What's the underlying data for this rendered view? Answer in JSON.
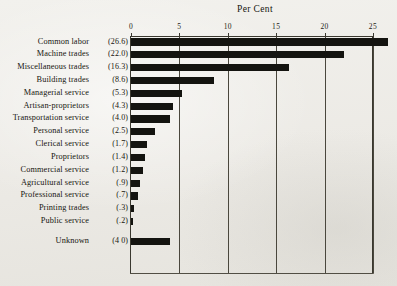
{
  "chart_data": {
    "type": "bar",
    "orientation": "horizontal",
    "title": "Per Cent",
    "xlabel": "",
    "ylabel": "",
    "xlim": [
      0,
      26.6
    ],
    "axis_max_tick": 25,
    "grid": true,
    "legend": null,
    "tick_labels": [
      "0",
      "5",
      "10",
      "15",
      "20",
      "25"
    ],
    "tick_values": [
      0,
      5,
      10,
      15,
      20,
      25
    ],
    "categories": [
      "Common labor",
      "Machine trades",
      "Miscellaneous trades",
      "Building trades",
      "Managerial service",
      "Artisan-proprietors",
      "Transportation service",
      "Personal service",
      "Clerical service",
      "Proprietors",
      "Commercial service",
      "Agricultural service",
      "Professional service",
      "Printing trades",
      "Public service",
      "Unknown"
    ],
    "values": [
      26.6,
      22.0,
      16.3,
      8.6,
      5.3,
      4.3,
      4.0,
      2.5,
      1.7,
      1.4,
      1.2,
      0.9,
      0.7,
      0.3,
      0.2,
      4.0
    ],
    "value_labels": [
      "(26.6)",
      "(22.0)",
      "(16.3)",
      "(8.6)",
      "(5.3)",
      "(4.3)",
      "(4.0)",
      "(2.5)",
      "(1.7)",
      "(1.4)",
      "(1.2)",
      "(.9)",
      "(.7)",
      "(.3)",
      "(.2)",
      "(4 0)"
    ],
    "separated_rows": [
      "Unknown"
    ],
    "bar_color": "#141410",
    "background_color": "#efeeea"
  }
}
